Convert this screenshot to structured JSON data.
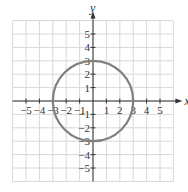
{
  "chart_data": {
    "type": "line",
    "title": "",
    "xlabel": "x",
    "ylabel": "y",
    "xlim": [
      -6,
      6
    ],
    "ylim": [
      -6,
      6
    ],
    "grid": true,
    "x_ticks": [
      -5,
      -4,
      -3,
      -2,
      -1,
      1,
      2,
      3,
      4,
      5
    ],
    "y_ticks": [
      -5,
      -4,
      -3,
      -2,
      -1,
      1,
      2,
      3,
      4,
      5
    ],
    "x_tick_labels": [
      "−5",
      "−4",
      "−3",
      "−2",
      "−1",
      "1",
      "2",
      "3",
      "4",
      "5"
    ],
    "y_tick_labels": [
      "−5",
      "−4",
      "−3",
      "−2",
      "−1",
      "1",
      "2",
      "3",
      "4",
      "5"
    ],
    "series": [
      {
        "name": "circle",
        "shape": "circle",
        "center": [
          0,
          0
        ],
        "radius": 3,
        "equation": "x^2 + y^2 = 9",
        "color": "#808080"
      }
    ]
  },
  "colors": {
    "grid": "#d8d8d8",
    "axis": "#333333",
    "curve": "#808080"
  }
}
